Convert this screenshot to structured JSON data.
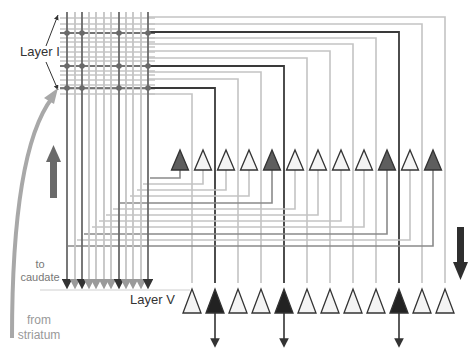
{
  "labels": {
    "layer_one": "Layer I",
    "layer_five": "Layer V",
    "to_caudate_line1": "to",
    "to_caudate_line2": "caudate",
    "from_striatum_line1": "from",
    "from_striatum_line2": "striatum"
  },
  "colors": {
    "light_line": "#c4c4c4",
    "mid_line": "#8a8a8a",
    "dark_line": "#3a3a3a",
    "light_neuron_fill": "#f4f4f4",
    "mid_neuron_fill": "#5e5e5e",
    "dark_neuron_fill": "#222222",
    "striatum_arrow": "#a8a8a8",
    "up_arrow": "#6a6a6a",
    "down_arrow": "#2e2e2e"
  },
  "upper_neurons": {
    "count": 12,
    "x_positions": [
      180,
      203,
      226,
      249,
      272,
      295,
      318,
      341,
      364,
      387,
      410,
      433
    ],
    "filled_indices": [
      0,
      4,
      9,
      11
    ]
  },
  "layer_v_neurons": {
    "count": 12,
    "x_positions": [
      192,
      215,
      238,
      261,
      284,
      307,
      330,
      353,
      376,
      399,
      422,
      445
    ],
    "filled_indices": [
      1,
      4,
      9
    ]
  },
  "vertical_bundle": {
    "count": 12,
    "x_positions": [
      67,
      75,
      82,
      89,
      96,
      104,
      111,
      119,
      126,
      133,
      141,
      148
    ],
    "dark_indices": [
      0,
      2,
      7,
      11
    ]
  }
}
